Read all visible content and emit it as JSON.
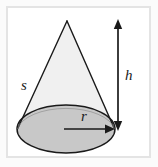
{
  "figure": {
    "kind": "geometry-diagram",
    "shape_name": "cone",
    "frame": {
      "border_color": "#e4e4e4",
      "background_color": "#ffffff",
      "outer_background_color": "#fbfbfb"
    },
    "colors": {
      "cone_body_fill": "#f0f0f0",
      "base_ellipse_fill": "#c8c8c8",
      "outline": "#1a1a1a",
      "arrow": "#1a1a1a",
      "label_text": "#1a1a1a"
    },
    "labels": {
      "slant_height": "s",
      "height": "h",
      "radius": "r"
    },
    "annotations": [
      {
        "name": "slant-height",
        "symbol": "s",
        "marks": "none",
        "position": "left of cone slant side"
      },
      {
        "name": "cone-height",
        "symbol": "h",
        "marks": "double-headed vertical arrow",
        "position": "right of cone"
      },
      {
        "name": "base-radius",
        "symbol": "r",
        "marks": "single-headed horizontal arrow",
        "position": "inside base ellipse, center to right edge"
      }
    ],
    "geometry": {
      "apex": {
        "x": 67,
        "y": 21
      },
      "base_ellipse": {
        "cx": 66,
        "cy": 129,
        "rx": 49,
        "ry": 24
      },
      "height_arrow": {
        "x": 118,
        "y_top": 21,
        "y_bottom": 129
      },
      "radius_arrow": {
        "y": 129,
        "x_start": 66,
        "x_end": 114
      }
    }
  }
}
